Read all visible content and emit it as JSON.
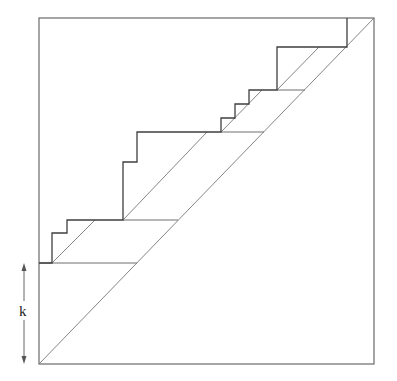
{
  "diagram": {
    "type": "staircase-lattice-path",
    "frame": {
      "x1": 39,
      "y1": 18,
      "x2": 374,
      "y2": 364
    },
    "main_diagonal": {
      "from": [
        39,
        364
      ],
      "to": [
        374,
        18
      ]
    },
    "staircase_points": [
      [
        347,
        18
      ],
      [
        347,
        47
      ],
      [
        277,
        47
      ],
      [
        277,
        90
      ],
      [
        249,
        90
      ],
      [
        249,
        104
      ],
      [
        235,
        104
      ],
      [
        235,
        118
      ],
      [
        221,
        118
      ],
      [
        221,
        132
      ],
      [
        137,
        132
      ],
      [
        137,
        162
      ],
      [
        123,
        162
      ],
      [
        123,
        220
      ],
      [
        67,
        220
      ],
      [
        67,
        233
      ],
      [
        52,
        233
      ],
      [
        52,
        263
      ],
      [
        39,
        263
      ]
    ],
    "horizontal_segments": [
      {
        "y": 263,
        "x1": 39,
        "x2": 137
      },
      {
        "y": 220,
        "x1": 123,
        "x2": 178
      },
      {
        "y": 132,
        "x1": 221,
        "x2": 264
      },
      {
        "y": 90,
        "x1": 277,
        "x2": 305
      }
    ],
    "parallel_diagonals": [
      {
        "from": [
          52,
          263
        ],
        "to": [
          95,
          220
        ]
      },
      {
        "from": [
          123,
          220
        ],
        "to": [
          207,
          132
        ]
      },
      {
        "from": [
          221,
          132
        ],
        "to": [
          262,
          90
        ]
      },
      {
        "from": [
          277,
          90
        ],
        "to": [
          319,
          47
        ]
      }
    ],
    "k_arrow": {
      "x": 24,
      "y1": 263,
      "y2": 364
    },
    "labels": {
      "k": "k"
    },
    "colors": {
      "line": "#3f3f3f",
      "diagonal": "#777777",
      "frame": "#6a6a6a"
    }
  }
}
